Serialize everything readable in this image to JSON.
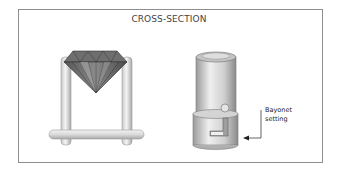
{
  "diagram": {
    "title": "CROSS-SECTION",
    "figures": [
      {
        "name": "prong-setting-with-diamond",
        "description": "Round brilliant diamond held between two vertical posts on a horizontal bar"
      },
      {
        "name": "bayonet-setting-cylinder",
        "description": "Cylindrical mount with pin and L-shaped slot"
      }
    ],
    "annotation": {
      "line1": "Bayonet",
      "line2": "setting"
    }
  }
}
